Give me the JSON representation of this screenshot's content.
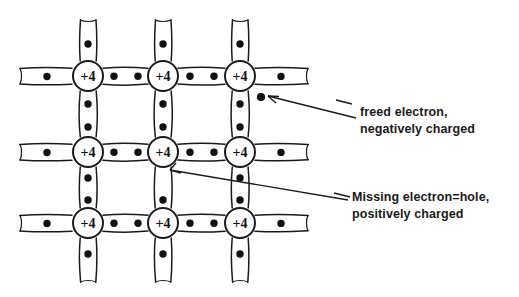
{
  "diagram": {
    "type": "covalent-bond-lattice",
    "background_color": "#ffffff",
    "ink_color": "#1a1a1a",
    "atom": {
      "label": "+4",
      "count": 9,
      "radius": 15,
      "rows": 3,
      "columns": 3,
      "centers_x": [
        88,
        163,
        240
      ],
      "centers_y": [
        76,
        152,
        223
      ],
      "meaning": "silicon ion core with charge +4"
    },
    "bond": {
      "electrons_per_full_bond": 2,
      "electrons_per_edge_stub": 1,
      "style": "double-parallel-line tube",
      "electron_dot_radius": 3.6,
      "electron_dot_color": "#111111"
    },
    "defects": [
      {
        "name": "freed-electron",
        "kind": "electron",
        "x": 261,
        "y": 97,
        "charge": "negative",
        "label_line1": "freed electron,",
        "label_line2": "negatively charged"
      },
      {
        "name": "hole",
        "kind": "vacancy",
        "x": 163,
        "y": 178,
        "charge": "positive",
        "label_line1": "Missing electron=hole,",
        "label_line2": "positively charged"
      }
    ],
    "annotations": [
      {
        "name": "freed-electron-annotation",
        "line1": "freed electron,",
        "line2": "negatively charged",
        "arrow_from_x": 352,
        "arrow_from_y": 117,
        "arrow_to_x": 266,
        "arrow_to_y": 96
      },
      {
        "name": "hole-annotation",
        "line1": "Missing electron=hole,",
        "line2": "positively charged",
        "arrow_from_x": 346,
        "arrow_from_y": 199,
        "arrow_to_x": 170,
        "arrow_to_y": 170
      }
    ]
  }
}
